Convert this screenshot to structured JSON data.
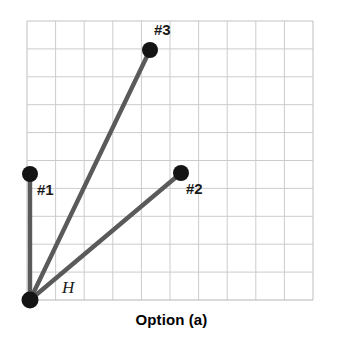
{
  "chart_data": {
    "type": "scatter",
    "title": "Option (a)",
    "xlabel": "",
    "ylabel": "",
    "grid": true,
    "grid_cols": 10,
    "grid_rows": 10,
    "xlim": [
      0,
      10
    ],
    "ylim": [
      0,
      10
    ],
    "legend": "none",
    "origin_label": "H",
    "series": [
      {
        "name": "#1",
        "label": "#1",
        "x": 0.1,
        "y": 4.5,
        "pixel": {
          "cx": 30,
          "cy": 174
        },
        "label_pixel": {
          "x": 37,
          "y": 182
        },
        "vector_from_origin": {
          "dx": 0,
          "dy": 4.5
        }
      },
      {
        "name": "#2",
        "label": "#2",
        "x": 5.4,
        "y": 4.55,
        "pixel": {
          "cx": 181,
          "cy": 173
        },
        "label_pixel": {
          "x": 186,
          "y": 181
        },
        "vector_from_origin": {
          "dx": 5.3,
          "dy": 4.55
        }
      },
      {
        "name": "#3",
        "label": "#3",
        "x": 4.3,
        "y": 8.95,
        "pixel": {
          "cx": 150,
          "cy": 50
        },
        "label_pixel": {
          "x": 155,
          "y": 22
        },
        "vector_from_origin": {
          "dx": 4.2,
          "dy": 8.95
        }
      }
    ],
    "origin": {
      "label": "H",
      "x": 0.1,
      "y": 0,
      "pixel": {
        "cx": 30,
        "cy": 300
      },
      "label_pixel": {
        "x": 62,
        "y": 280
      }
    },
    "annotations": [
      "#1",
      "#2",
      "#3",
      "H"
    ]
  },
  "figure": {
    "caption": "Option (a)"
  },
  "colors": {
    "line": "#5a5a5a",
    "point": "#141414",
    "grid": "#c9c9c9",
    "grid_border": "#b8b8b8",
    "background": "#ffffff",
    "text": "#1a1a1a"
  },
  "labels": {
    "p1": "#1",
    "p2": "#2",
    "p3": "#3",
    "origin": "H"
  }
}
